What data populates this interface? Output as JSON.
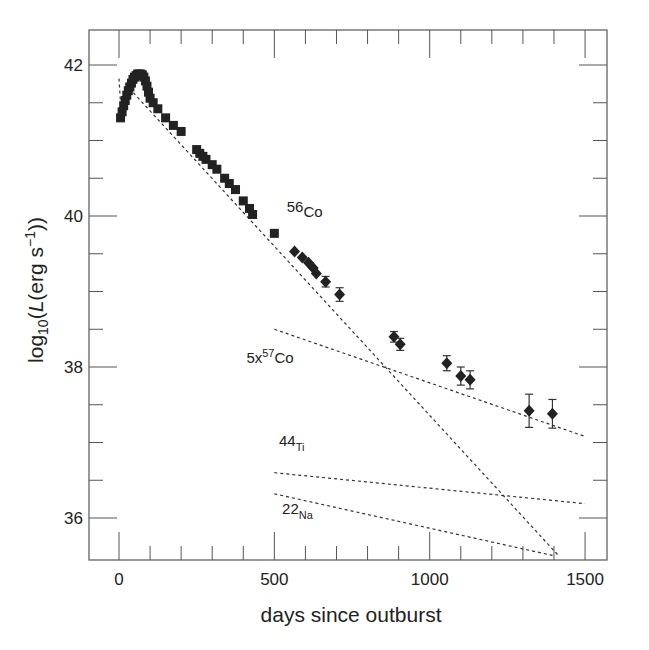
{
  "chart_data": {
    "type": "scatter",
    "title": "",
    "xlabel": "days since outburst",
    "ylabel_parts": {
      "pre": "log",
      "sub": "10",
      "mid": "(",
      "italic": "L",
      "post": "(erg s",
      "sup": "−1",
      "end": "))"
    },
    "ylabel": "log10(L(erg s^-1))",
    "xlim": [
      -100,
      1550
    ],
    "ylim": [
      35.5,
      42.45
    ],
    "x_ticks": [
      0,
      500,
      1000,
      1500
    ],
    "x_tick_labels": [
      "0",
      "500",
      "1000",
      "1500"
    ],
    "x_minor_step": 100,
    "y_ticks": [
      36,
      38,
      40,
      42
    ],
    "y_tick_labels": [
      "36",
      "38",
      "40",
      "42"
    ],
    "y_minor_step": 0.5,
    "grid": false,
    "series": [
      {
        "name": "observed luminosity (early, squares)",
        "marker": "square",
        "points": [
          [
            5,
            41.3
          ],
          [
            10,
            41.38
          ],
          [
            15,
            41.46
          ],
          [
            20,
            41.53
          ],
          [
            25,
            41.6
          ],
          [
            30,
            41.66
          ],
          [
            35,
            41.71
          ],
          [
            40,
            41.76
          ],
          [
            45,
            41.81
          ],
          [
            50,
            41.84
          ],
          [
            55,
            41.86
          ],
          [
            60,
            41.88
          ],
          [
            65,
            41.88
          ],
          [
            70,
            41.88
          ],
          [
            75,
            41.87
          ],
          [
            80,
            41.84
          ],
          [
            85,
            41.79
          ],
          [
            90,
            41.72
          ],
          [
            95,
            41.64
          ],
          [
            100,
            41.56
          ],
          [
            110,
            41.5
          ],
          [
            125,
            41.42
          ],
          [
            150,
            41.3
          ],
          [
            175,
            41.2
          ],
          [
            200,
            41.12
          ],
          [
            250,
            40.88
          ],
          [
            260,
            40.83
          ],
          [
            270,
            40.79
          ],
          [
            280,
            40.75
          ],
          [
            300,
            40.68
          ],
          [
            315,
            40.62
          ],
          [
            340,
            40.5
          ],
          [
            355,
            40.43
          ],
          [
            375,
            40.35
          ],
          [
            400,
            40.2
          ],
          [
            420,
            40.1
          ],
          [
            430,
            40.02
          ],
          [
            500,
            39.77
          ]
        ]
      },
      {
        "name": "observed luminosity (late, diamonds with error bars)",
        "marker": "diamond",
        "points": [
          {
            "x": 565,
            "y": 39.53,
            "err": 0
          },
          {
            "x": 590,
            "y": 39.45,
            "err": 0
          },
          {
            "x": 610,
            "y": 39.38,
            "err": 0
          },
          {
            "x": 625,
            "y": 39.31,
            "err": 0
          },
          {
            "x": 635,
            "y": 39.24,
            "err": 0
          },
          {
            "x": 665,
            "y": 39.13,
            "err": 0.07
          },
          {
            "x": 710,
            "y": 38.96,
            "err": 0.09
          },
          {
            "x": 885,
            "y": 38.4,
            "err": 0.07
          },
          {
            "x": 905,
            "y": 38.3,
            "err": 0.08
          },
          {
            "x": 1055,
            "y": 38.05,
            "err": 0.1
          },
          {
            "x": 1100,
            "y": 37.88,
            "err": 0.12
          },
          {
            "x": 1130,
            "y": 37.83,
            "err": 0.12
          },
          {
            "x": 1320,
            "y": 37.42,
            "err": 0.22
          },
          {
            "x": 1395,
            "y": 37.38,
            "err": 0.19
          }
        ]
      },
      {
        "name": "56Co",
        "style": "dashed",
        "points": [
          [
            20,
            41.75
          ],
          [
            1415,
            35.5
          ]
        ]
      },
      {
        "name": "56Ni initial",
        "style": "dashed",
        "points": [
          [
            0,
            41.82
          ],
          [
            8,
            41.3
          ]
        ]
      },
      {
        "name": "5x57Co",
        "style": "dashed",
        "points": [
          [
            500,
            38.5
          ],
          [
            1500,
            37.08
          ]
        ]
      },
      {
        "name": "44Ti",
        "style": "dashed",
        "points": [
          [
            500,
            36.6
          ],
          [
            1500,
            36.19
          ]
        ]
      },
      {
        "name": "22Na",
        "style": "dashed",
        "points": [
          [
            500,
            36.32
          ],
          [
            1400,
            35.5
          ]
        ]
      }
    ],
    "annotations": [
      {
        "base": "56",
        "elem": "Co",
        "style": "sup-as-base",
        "x": 540,
        "y": 40.05
      },
      {
        "base": "5x",
        "sup": "57",
        "elem": "Co",
        "style": "sup",
        "x": 410,
        "y": 38.05
      },
      {
        "base": "44",
        "elem": "Ti",
        "style": "sub",
        "x": 515,
        "y": 36.95
      },
      {
        "base": "22",
        "elem": "Na",
        "style": "sub",
        "x": 525,
        "y": 36.05
      }
    ]
  }
}
